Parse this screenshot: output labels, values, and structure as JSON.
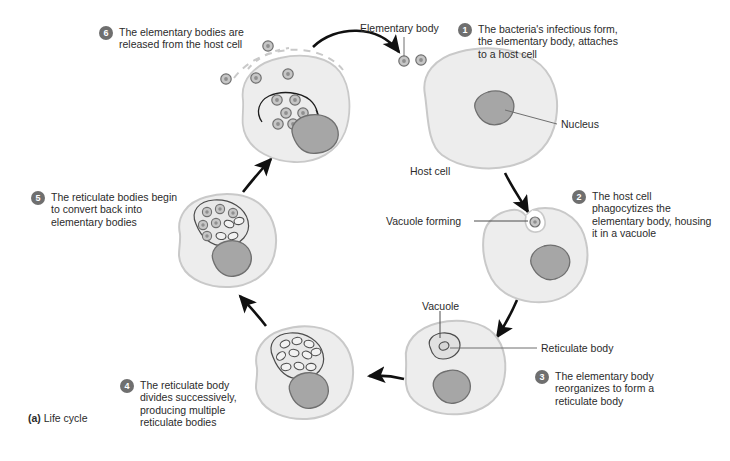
{
  "figure": {
    "caption_marker": "(a)",
    "caption_text": "Life cycle"
  },
  "steps": [
    {
      "number": "1",
      "text": "The bacteria's infectious form, the elementary body, attaches to a host cell",
      "name": "step-1"
    },
    {
      "number": "2",
      "text": "The host cell phagocytizes the elementary body, housing it in a vacuole",
      "name": "step-2"
    },
    {
      "number": "3",
      "text": "The elementary body reorganizes to form a reticulate body",
      "name": "step-3"
    },
    {
      "number": "4",
      "text": "The reticulate body divides successively, producing multiple reticulate bodies",
      "name": "step-4"
    },
    {
      "number": "5",
      "text": "The reticulate bodies begin to convert back into elementary bodies",
      "name": "step-5"
    },
    {
      "number": "6",
      "text": "The elementary bodies are released from the host cell",
      "name": "step-6"
    }
  ],
  "labels": {
    "elementary_body": "Elementary body",
    "nucleus": "Nucleus",
    "host_cell": "Host cell",
    "vacuole_forming": "Vacuole forming",
    "vacuole": "Vacuole",
    "reticulate_body": "Reticulate body"
  },
  "colors": {
    "cell_fill": "#ededed",
    "cell_stroke": "#c9c9c9",
    "nucleus_fill": "#a6a6a6",
    "nucleus_stroke": "#6f6f6f",
    "body_fill": "#b5b5b5",
    "body_stroke": "#6f6f6f",
    "vacuole_stroke": "#4d4d4d",
    "arrow": "#101010",
    "badge": "#6f6f6f",
    "text": "#2b2b2b",
    "background": "#ffffff"
  }
}
